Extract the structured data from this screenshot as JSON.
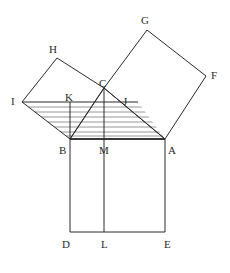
{
  "figure": {
    "background_color": "#ffffff",
    "stroke_color": "#2b2b2b",
    "hatch_color": "#8a8a8a",
    "label_color": "#2b2b2b",
    "width": 230,
    "height": 273
  },
  "points": {
    "A": {
      "label": "A",
      "x": 165,
      "y": 139,
      "label_x": 168,
      "label_y": 145
    },
    "B": {
      "label": "B",
      "x": 70,
      "y": 139,
      "label_x": 59,
      "label_y": 145
    },
    "C": {
      "label": "C",
      "x": 104,
      "y": 88,
      "label_x": 99,
      "label_y": 78
    },
    "D": {
      "label": "D",
      "x": 70,
      "y": 232,
      "label_x": 62,
      "label_y": 239
    },
    "E": {
      "label": "E",
      "x": 165,
      "y": 232,
      "label_x": 164,
      "label_y": 239
    },
    "F": {
      "label": "F",
      "x": 206,
      "y": 76,
      "label_x": 211,
      "label_y": 70
    },
    "G": {
      "label": "G",
      "x": 147,
      "y": 30,
      "label_x": 141,
      "label_y": 15
    },
    "H": {
      "label": "H",
      "x": 57,
      "y": 58,
      "label_x": 49,
      "label_y": 44
    },
    "I": {
      "label": "I",
      "x": 22,
      "y": 102,
      "label_x": 11,
      "label_y": 96
    },
    "J": {
      "label": "J",
      "x": 138,
      "y": 102,
      "label_x": 123,
      "label_y": 96
    },
    "K": {
      "label": "K",
      "x": 70,
      "y": 102,
      "label_x": 65,
      "label_y": 92
    },
    "L": {
      "label": "L",
      "x": 104,
      "y": 232,
      "label_x": 101,
      "label_y": 239
    },
    "M": {
      "label": "M",
      "x": 104,
      "y": 139,
      "label_x": 99,
      "label_y": 145
    }
  },
  "shapes": {
    "triangle_abc": {
      "name": "right-triangle-abc",
      "points": "70,139 165,139 104,88"
    },
    "square_bottom_abed": {
      "name": "square-on-hypotenuse-abed",
      "points": "70,139 165,139 165,232 70,232"
    },
    "square_left_bchi": {
      "name": "square-on-left-leg-bchi",
      "points": "70,139 104,88 57,58 22,102"
    },
    "square_right_cgfa": {
      "name": "square-on-right-leg-cgfa",
      "points": "104,88 147,30 206,76 165,139"
    },
    "hatched_region_ijab": {
      "name": "hatched-parallelogram-ijab",
      "points": "22,102 138,102 165,139 70,139"
    }
  },
  "segments": [
    {
      "name": "segment-ij",
      "x1": 22,
      "y1": 102,
      "x2": 138,
      "y2": 102
    },
    {
      "name": "segment-km",
      "x1": 70,
      "y1": 102,
      "x2": 70,
      "y2": 139
    },
    {
      "name": "segment-cm-l",
      "x1": 104,
      "y1": 88,
      "x2": 104,
      "y2": 232
    }
  ],
  "hatching": {
    "name": "horizontal-hatch-lines",
    "count": 7,
    "spacing": 5,
    "start_y": 107,
    "color": "#8a8a8a"
  }
}
